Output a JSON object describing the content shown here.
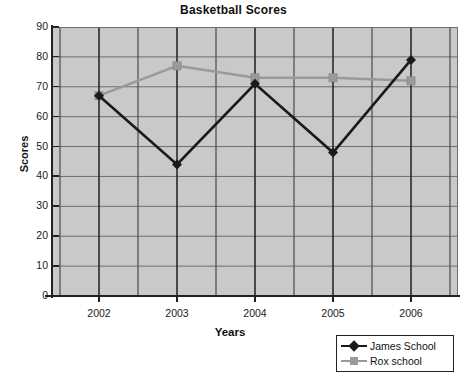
{
  "chart_data": {
    "type": "line",
    "title": "Basketball Scores",
    "xlabel": "Years",
    "ylabel": "Scores",
    "categories": [
      "2002",
      "2003",
      "2004",
      "2005",
      "2006"
    ],
    "x": [
      2002,
      2003,
      2004,
      2005,
      2006
    ],
    "ylim": [
      0,
      90
    ],
    "yticks": [
      "0",
      "10",
      "20",
      "30",
      "40",
      "50",
      "60",
      "70",
      "80",
      "90"
    ],
    "ytick_values": [
      0,
      10,
      20,
      30,
      40,
      50,
      60,
      70,
      80,
      90
    ],
    "grid": true,
    "grid_axes": "both",
    "legend_position": "bottom-right",
    "plot_background": "#c9c9c9",
    "series": [
      {
        "name": "James School",
        "color": "#1a1a1a",
        "marker": "diamond",
        "values": [
          67,
          44,
          71,
          48,
          79
        ]
      },
      {
        "name": "Rox school",
        "color": "#9a9a9a",
        "marker": "square",
        "values": [
          67,
          77,
          73,
          73,
          72
        ]
      }
    ]
  },
  "legend": {
    "items": [
      {
        "label": "James School",
        "color": "#1a1a1a",
        "marker": "diamond"
      },
      {
        "label": "Rox school",
        "color": "#9a9a9a",
        "marker": "square"
      }
    ]
  }
}
